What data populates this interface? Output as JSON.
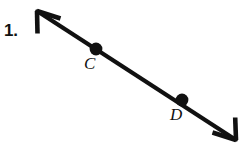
{
  "figure": {
    "problem_number": "1.",
    "background_color": "#ffffff",
    "ink_color": "#111111",
    "labels": [
      {
        "text": "C",
        "name": "point-label-c"
      },
      {
        "text": "D",
        "name": "point-label-d"
      }
    ],
    "geometry": {
      "line": {
        "start": {
          "x": 37,
          "y": 11
        },
        "end": {
          "x": 236,
          "y": 140
        },
        "stroke_width": 4.2,
        "arrowhead_start": "open-v",
        "arrowhead_end": "open-v"
      },
      "points": [
        {
          "label": "C",
          "x": 96,
          "y": 49,
          "radius": 6.4
        },
        {
          "label": "D",
          "x": 182,
          "y": 100,
          "radius": 6.4
        }
      ]
    }
  }
}
